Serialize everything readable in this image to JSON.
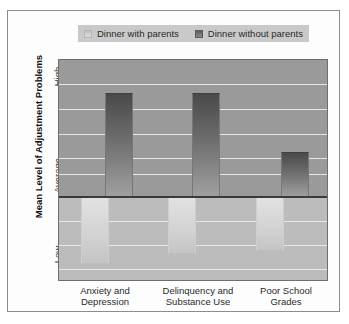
{
  "figure": {
    "background": "#fdfdfd",
    "border_color": "#8d8d8d"
  },
  "legend": {
    "position": "top-center",
    "entries": [
      {
        "label": "Dinner with parents",
        "swatch": "light-gray-swatch",
        "color": "#d2d2d2"
      },
      {
        "label": "Dinner without parents",
        "swatch": "dark-gray-swatch",
        "color": "#6e6e6e"
      }
    ]
  },
  "axes": {
    "y_title": "Mean Level of Adjustment Problems",
    "y_ticks": [
      "High",
      "Average",
      "Low"
    ],
    "x_labels": [
      "Anxiety and\nDepression",
      "Delinquency and\nSubstance Use",
      "Poor School\nGrades"
    ]
  },
  "chart_data": {
    "type": "bar",
    "title": "",
    "subtitle": "",
    "xlabel": "",
    "ylabel": "Mean Level of Adjustment Problems",
    "categories": [
      "Anxiety and Depression",
      "Delinquency and Substance Use",
      "Poor School Grades"
    ],
    "series": [
      {
        "name": "Dinner with parents",
        "color": "#d2d2d2",
        "values": [
          -0.55,
          -0.45,
          -0.42
        ]
      },
      {
        "name": "Dinner without parents",
        "color": "#6e6e6e",
        "values": [
          1.05,
          1.05,
          0.48
        ]
      }
    ],
    "ylim": [
      -1,
      1.35
    ],
    "ytick_values": [
      1.25,
      0,
      -1
    ],
    "ytick_labels": [
      "High",
      "Average",
      "Low"
    ],
    "baseline_value": 0,
    "baseline_label": "Average",
    "grid": true,
    "grid_axis": "y",
    "legend_position": "top-center",
    "note": "Bars are deviations from the Average baseline: dark bars rise above Average, light bars fall below Average."
  },
  "geometry": {
    "plot": {
      "left": 50,
      "top": 48,
      "width": 270,
      "height": 222
    },
    "baseline_y": 137,
    "gridline_ys": [
      24,
      49,
      74,
      98,
      114,
      161,
      185,
      209
    ],
    "bars": [
      {
        "series": "dark",
        "left": 46,
        "width": 28,
        "top": 33,
        "bottom": 137
      },
      {
        "series": "light",
        "left": 22,
        "width": 28,
        "top": 137,
        "bottom": 204
      },
      {
        "series": "dark",
        "left": 133,
        "width": 28,
        "top": 33,
        "bottom": 137
      },
      {
        "series": "light",
        "left": 109,
        "width": 28,
        "top": 137,
        "bottom": 194
      },
      {
        "series": "dark",
        "left": 222,
        "width": 28,
        "top": 92,
        "bottom": 137
      },
      {
        "series": "light",
        "left": 197,
        "width": 28,
        "top": 137,
        "bottom": 191
      }
    ]
  }
}
